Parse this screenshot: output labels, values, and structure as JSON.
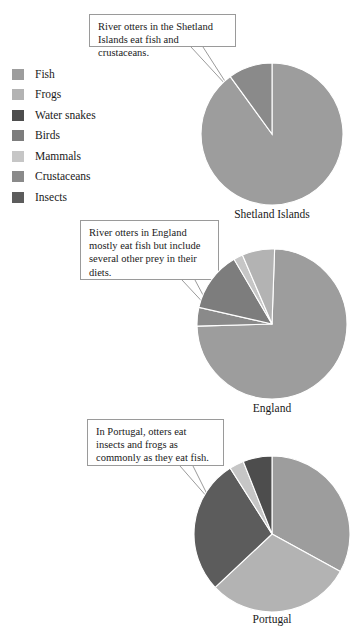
{
  "legend": {
    "items": [
      {
        "label": "Fish",
        "color": "#9d9d9d",
        "key": "fish"
      },
      {
        "label": "Frogs",
        "color": "#b3b3b3",
        "key": "frogs"
      },
      {
        "label": "Water snakes",
        "color": "#4d4d4d",
        "key": "water-snakes"
      },
      {
        "label": "Birds",
        "color": "#7d7d7d",
        "key": "birds"
      },
      {
        "label": "Mammals",
        "color": "#c6c6c6",
        "key": "mammals"
      },
      {
        "label": "Crustaceans",
        "color": "#8a8a8a",
        "key": "crustaceans"
      },
      {
        "label": "Insects",
        "color": "#5c5c5c",
        "key": "insects"
      }
    ]
  },
  "callouts": [
    {
      "id": "shetland",
      "text": "River otters in the Shetland Islands eat fish and crustaceans."
    },
    {
      "id": "england",
      "text": "River otters in England mostly eat fish but include several other prey in their diets."
    },
    {
      "id": "portugal",
      "text": "In Portugal, otters eat insects and frogs as commonly as they eat fish."
    }
  ],
  "charts": [
    {
      "id": "shetland",
      "label": "Shetland Islands",
      "slices": [
        {
          "name": "Fish",
          "value": 90,
          "color": "#9d9d9d"
        },
        {
          "name": "Crustaceans",
          "value": 10,
          "color": "#8a8a8a"
        }
      ]
    },
    {
      "id": "england",
      "label": "England",
      "slices": [
        {
          "name": "Fish",
          "value": 74,
          "color": "#9d9d9d"
        },
        {
          "name": "Crustaceans",
          "value": 4,
          "color": "#8a8a8a"
        },
        {
          "name": "Birds",
          "value": 13,
          "color": "#7d7d7d"
        },
        {
          "name": "Mammals",
          "value": 2,
          "color": "#c6c6c6"
        },
        {
          "name": "Frogs",
          "value": 7,
          "color": "#b3b3b3"
        }
      ]
    },
    {
      "id": "portugal",
      "label": "Portugal",
      "slices": [
        {
          "name": "Fish",
          "value": 33,
          "color": "#9d9d9d"
        },
        {
          "name": "Frogs",
          "value": 30,
          "color": "#b3b3b3"
        },
        {
          "name": "Insects",
          "value": 28,
          "color": "#5c5c5c"
        },
        {
          "name": "Mammals",
          "value": 3,
          "color": "#c6c6c6"
        },
        {
          "name": "Water snakes",
          "value": 6,
          "color": "#4d4d4d"
        }
      ]
    }
  ],
  "chart_data": {
    "type": "pie",
    "title": "",
    "legend_position": "left",
    "categories": [
      "Fish",
      "Frogs",
      "Water snakes",
      "Birds",
      "Mammals",
      "Crustaceans",
      "Insects"
    ],
    "charts": [
      {
        "name": "Shetland Islands",
        "annotation": "River otters in the Shetland Islands eat fish and crustaceans.",
        "labels": [
          "Fish",
          "Crustaceans"
        ],
        "values": [
          90,
          10
        ],
        "unit": "percent"
      },
      {
        "name": "England",
        "annotation": "River otters in England mostly eat fish but include several other prey in their diets.",
        "labels": [
          "Fish",
          "Crustaceans",
          "Birds",
          "Mammals",
          "Frogs"
        ],
        "values": [
          74,
          4,
          13,
          2,
          7
        ],
        "unit": "percent"
      },
      {
        "name": "Portugal",
        "annotation": "In Portugal, otters eat insects and frogs as commonly as they eat fish.",
        "labels": [
          "Fish",
          "Frogs",
          "Insects",
          "Mammals",
          "Water snakes"
        ],
        "values": [
          33,
          30,
          28,
          3,
          6
        ],
        "unit": "percent"
      }
    ]
  }
}
